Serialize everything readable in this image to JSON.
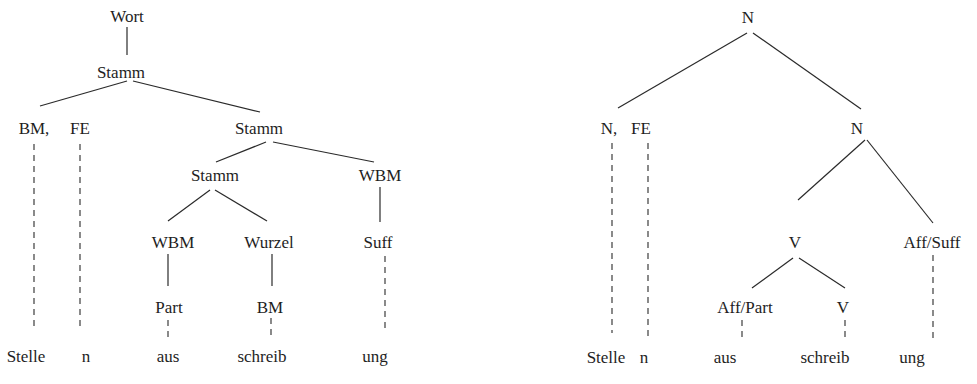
{
  "left_tree": {
    "nodes": {
      "wort": "Wort",
      "stamm_root": "Stamm",
      "bm_comma": "BM,",
      "fe": "FE",
      "stamm_right": "Stamm",
      "stamm_mid": "Stamm",
      "wbm_right": "WBM",
      "wbm_left": "WBM",
      "wurzel": "Wurzel",
      "suff": "Suff",
      "part": "Part",
      "bm": "BM"
    },
    "words": [
      "Stelle",
      "n",
      "aus",
      "schreib",
      "ung"
    ]
  },
  "right_tree": {
    "nodes": {
      "n_root": "N",
      "n_comma": "N,",
      "fe": "FE",
      "n_right": "N",
      "v_mid": "V",
      "aff_suff": "Aff/Suff",
      "aff_part": "Aff/Part",
      "v_leaf": "V"
    },
    "words": [
      "Stelle",
      "n",
      "aus",
      "schreib",
      "ung"
    ]
  }
}
